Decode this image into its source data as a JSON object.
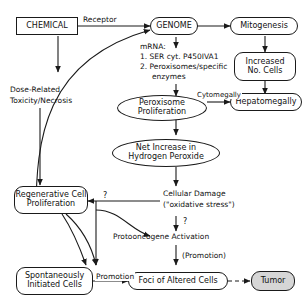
{
  "diagram": {
    "nodes": {
      "chemical": {
        "label": "CHEMICAL",
        "shape": "rect"
      },
      "genome": {
        "label": "GENOME",
        "shape": "rounded"
      },
      "mitogenesis": {
        "label": "Mitogenesis",
        "shape": "rounded"
      },
      "increased_no_cells": {
        "line1": "Increased",
        "line2": "No. Cells",
        "shape": "rounded"
      },
      "hepatomegally": {
        "label": "Hepatomegally",
        "shape": "rounded"
      },
      "peroxisome_proliferation": {
        "line1": "Peroxisome",
        "line2": "Proliferation",
        "shape": "ellipse"
      },
      "net_increase_h2o2": {
        "line1": "Net Increase in",
        "line2": "Hydrogen Peroxide",
        "shape": "ellipse"
      },
      "regenerative_cell_proliferation": {
        "line1": "Regenerative Cell",
        "line2": "Proliferation",
        "shape": "rounded"
      },
      "spontaneously_initiated_cells": {
        "line1": "Spontaneously",
        "line2": "Initiated Cells",
        "shape": "rounded"
      },
      "foci_of_altered_cells": {
        "label": "Foci of Altered Cells",
        "shape": "rounded"
      },
      "tumor": {
        "label": "Tumor",
        "shape": "rounded-shaded"
      }
    },
    "free_text": {
      "mrna_heading": "mRNA:",
      "mrna_item1": "1. SER cyt. P450IVA1",
      "mrna_item2": "2. Peroxisomes/specific",
      "mrna_item2_cont": "enzymes",
      "dose_related_line1": "Dose-Related",
      "dose_related_line2": "Toxicity/Necrosis",
      "cellular_damage_line1": "Cellular Damage",
      "cellular_damage_line2": "(\"oxidative stress\")",
      "protooncogene_activation": "Protooncogene Activation",
      "promotion_parenthetical": "(Promotion)"
    },
    "edge_labels": {
      "receptor": "Receptor",
      "cytomegally": "Cytomegally",
      "question_damage_to_regen": "?",
      "question_damage_to_protooncogene": "?",
      "promotion": "Promotion"
    }
  }
}
